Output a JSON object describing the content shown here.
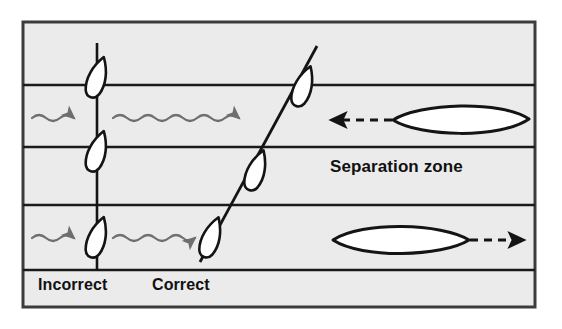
{
  "figure": {
    "type": "diagram",
    "background_color": "#ffffff",
    "lane_fill": "#ebebeb",
    "frame_color": "#3c3c3c",
    "line_color": "#1a1a1a",
    "wave_color": "#6e6e6e",
    "text_color": "#111111"
  },
  "labels": {
    "incorrect": "Incorrect",
    "correct": "Correct",
    "separation_zone": "Separation zone"
  },
  "frame": {
    "x": 23,
    "y": 22,
    "width": 512,
    "height": 285
  },
  "lanes": [
    {
      "name": "top-margin-band",
      "y_top": 22,
      "y_bottom": 85,
      "fill": "#ebebeb"
    },
    {
      "name": "upper-traffic-lane",
      "y_top": 85,
      "y_bottom": 147,
      "fill": "#ebebeb"
    },
    {
      "name": "separation-zone-lane",
      "y_top": 147,
      "y_bottom": 205,
      "fill": "#ebebeb"
    },
    {
      "name": "lower-traffic-lane",
      "y_top": 205,
      "y_bottom": 270,
      "fill": "#ebebeb"
    },
    {
      "name": "bottom-label-band",
      "y_top": 270,
      "y_bottom": 307,
      "fill": "#ebebeb"
    }
  ],
  "lane_divider_y": [
    85,
    147,
    205,
    270
  ],
  "tracks": {
    "incorrect": {
      "label": "Incorrect",
      "kind": "vertical-crossing-track",
      "x": 97,
      "y_start": 43,
      "y_end": 270,
      "vessels": [
        {
          "name": "vessel-incorrect-upper",
          "cx": 97,
          "cy": 78,
          "rotation_deg": 18
        },
        {
          "name": "vessel-incorrect-middle",
          "cx": 97,
          "cy": 152,
          "rotation_deg": 18
        },
        {
          "name": "vessel-incorrect-lower",
          "cx": 97,
          "cy": 238,
          "rotation_deg": 18
        }
      ]
    },
    "correct": {
      "label": "Correct",
      "kind": "angled-crossing-track",
      "x_start": 200,
      "y_start": 262,
      "x_end": 317,
      "y_end": 46,
      "vessels": [
        {
          "name": "vessel-correct-lower",
          "cx": 211,
          "cy": 238,
          "rotation_deg": 20
        },
        {
          "name": "vessel-correct-middle",
          "cx": 256,
          "cy": 171,
          "rotation_deg": 20
        },
        {
          "name": "vessel-correct-upper",
          "cx": 303,
          "cy": 87,
          "rotation_deg": 20
        }
      ]
    }
  },
  "wavy_arrows": [
    {
      "name": "wave-upper-left",
      "x_start": 32,
      "x_end": 90,
      "y": 118,
      "direction": "right"
    },
    {
      "name": "wave-upper-right",
      "x_start": 113,
      "x_end": 262,
      "y": 118,
      "direction": "right"
    },
    {
      "name": "wave-lower-left",
      "x_start": 32,
      "x_end": 90,
      "y": 238,
      "direction": "right"
    },
    {
      "name": "wave-lower-right",
      "x_start": 113,
      "x_end": 200,
      "y": 238,
      "direction": "right"
    }
  ],
  "traffic_vessels": [
    {
      "name": "traffic-vessel-upper",
      "cx": 461,
      "cy": 120,
      "rx": 68,
      "ry": 19,
      "heading": "left",
      "arrow": {
        "x_start": 392,
        "x_end": 330,
        "y": 120,
        "style": "dashed",
        "direction": "left"
      }
    },
    {
      "name": "traffic-vessel-lower",
      "cx": 400,
      "cy": 240,
      "rx": 68,
      "ry": 19,
      "heading": "right",
      "arrow": {
        "x_start": 470,
        "x_end": 525,
        "y": 240,
        "style": "dashed",
        "direction": "right"
      }
    }
  ]
}
